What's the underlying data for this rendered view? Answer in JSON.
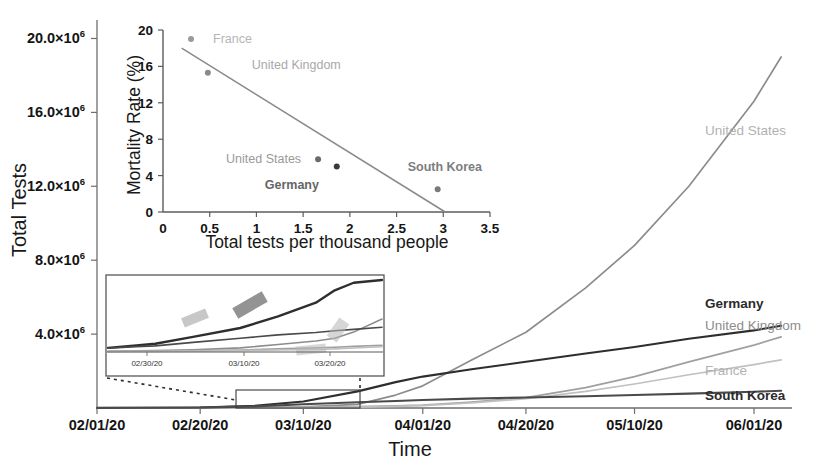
{
  "chart_data": {
    "type": "line",
    "title": "",
    "xlabel": "Time",
    "ylabel": "Total Tests",
    "xtick_labels": [
      "02/01/20",
      "02/20/20",
      "03/10/20",
      "04/01/20",
      "04/20/20",
      "05/10/20",
      "06/01/20"
    ],
    "ytick_labels": [
      "4.0×10",
      "8.0×10",
      "12.0×10",
      "16.0×10",
      "20.0×10"
    ],
    "ytick_exponent": "6",
    "ytick_values": [
      4000000,
      8000000,
      12000000,
      16000000,
      20000000
    ],
    "ylim": [
      0,
      21000000
    ],
    "xlim": [
      "02/01/20",
      "06/08/20"
    ],
    "grid": false,
    "legend_position": "inline-right-of-line-ends",
    "series": [
      {
        "name": "United States",
        "color": "#8c8c8c",
        "label_color": "#b0b0b0",
        "x": [
          "02/01/20",
          "02/20/20",
          "03/01/20",
          "03/10/20",
          "03/20/20",
          "03/27/20",
          "04/01/20",
          "04/10/20",
          "04/20/20",
          "05/01/20",
          "05/10/20",
          "05/20/20",
          "06/01/20",
          "06/06/20"
        ],
        "values": [
          2000,
          8000,
          20000,
          60000,
          200000,
          700000,
          1200000,
          2600000,
          4100000,
          6500000,
          8800000,
          12000000,
          16600000,
          19000000
        ]
      },
      {
        "name": "Germany",
        "color": "#2e2e2e",
        "label_color": "#2b2b2b",
        "x": [
          "02/01/20",
          "02/20/20",
          "03/01/20",
          "03/10/20",
          "03/20/20",
          "03/27/20",
          "04/01/20",
          "04/10/20",
          "04/20/20",
          "05/01/20",
          "05/10/20",
          "05/20/20",
          "06/01/20",
          "06/06/20"
        ],
        "values": [
          5000,
          30000,
          120000,
          350000,
          900000,
          1400000,
          1700000,
          2100000,
          2500000,
          2950000,
          3300000,
          3750000,
          4200000,
          4450000
        ]
      },
      {
        "name": "United Kingdom",
        "color": "#a0a0a0",
        "label_color": "#9b9b9b",
        "x": [
          "02/01/20",
          "02/20/20",
          "03/01/20",
          "03/10/20",
          "03/20/20",
          "03/27/20",
          "04/01/20",
          "04/10/20",
          "04/20/20",
          "05/01/20",
          "05/10/20",
          "05/20/20",
          "06/01/20",
          "06/06/20"
        ],
        "values": [
          1000,
          5000,
          15000,
          30000,
          70000,
          110000,
          160000,
          320000,
          560000,
          1100000,
          1700000,
          2500000,
          3400000,
          3850000
        ]
      },
      {
        "name": "France",
        "color": "#c0c0c0",
        "label_color": "#bdbdbd",
        "x": [
          "02/01/20",
          "02/20/20",
          "03/01/20",
          "03/10/20",
          "03/20/20",
          "03/27/20",
          "04/01/20",
          "04/10/20",
          "04/20/20",
          "05/01/20",
          "05/10/20",
          "05/20/20",
          "06/01/20",
          "06/06/20"
        ],
        "values": [
          500,
          2000,
          8000,
          20000,
          45000,
          90000,
          130000,
          280000,
          500000,
          900000,
          1300000,
          1800000,
          2350000,
          2600000
        ]
      },
      {
        "name": "South Korea",
        "color": "#4a4a4a",
        "label_color": "#2b2b2b",
        "x": [
          "02/01/20",
          "02/20/20",
          "03/01/20",
          "03/10/20",
          "03/20/20",
          "03/27/20",
          "04/01/20",
          "04/10/20",
          "04/20/20",
          "05/01/20",
          "05/10/20",
          "05/20/20",
          "06/01/20",
          "06/06/20"
        ],
        "values": [
          3000,
          20000,
          90000,
          200000,
          310000,
          380000,
          430000,
          510000,
          570000,
          640000,
          700000,
          780000,
          880000,
          930000
        ]
      }
    ],
    "magnifier_inset": {
      "description": "zoomed view of 02/25/20 - 03/25/20 region",
      "xtick_labels": [
        "02/30/20",
        "03/10/20",
        "03/20/20"
      ],
      "source_region": {
        "x_from": "02/27/20",
        "x_to": "03/24/20"
      }
    },
    "scatter_inset": {
      "type": "scatter",
      "xlabel": "Total tests per thousand people",
      "ylabel": "Mortality Rate (%)",
      "xlim": [
        0,
        3.5
      ],
      "ylim": [
        0,
        20
      ],
      "xtick_labels": [
        "0",
        "0.5",
        "1",
        "1.5",
        "2",
        "2.5",
        "3",
        "3.5"
      ],
      "xtick_values": [
        0,
        0.5,
        1,
        1.5,
        2,
        2.5,
        3,
        3.5
      ],
      "ytick_labels": [
        "0",
        "4",
        "8",
        "12",
        "16",
        "20"
      ],
      "ytick_values": [
        0,
        4,
        8,
        12,
        16,
        20
      ],
      "grid": false,
      "points": [
        {
          "label": "France",
          "x": 0.3,
          "y": 19.0,
          "color": "#9a9a9a",
          "label_color": "#b5b5b5",
          "label_dx": 22,
          "label_dy": 4
        },
        {
          "label": "United Kingdom",
          "x": 0.48,
          "y": 15.3,
          "color": "#8a8a8a",
          "label_color": "#a8a8a8",
          "label_dx": 44,
          "label_dy": -4
        },
        {
          "label": "United States",
          "x": 1.66,
          "y": 5.8,
          "color": "#6a6a6a",
          "label_color": "#9a9a9a",
          "label_dx": -92,
          "label_dy": 4
        },
        {
          "label": "Germany",
          "x": 1.86,
          "y": 5.0,
          "color": "#3a3a3a",
          "label_color": "#666666",
          "label_dx": -72,
          "label_dy": 22
        },
        {
          "label": "South Korea",
          "x": 2.94,
          "y": 2.5,
          "color": "#7a7a7a",
          "label_color": "#7d7d7d",
          "label_dx": -30,
          "label_dy": -18
        }
      ],
      "trendline": {
        "x1": 0.2,
        "y1": 18.0,
        "x2": 3.02,
        "y2": 0.0,
        "color": "#8a8a8a"
      }
    }
  },
  "axes": {
    "y_title": "Total Tests",
    "x_title": "Time"
  },
  "inset_axes": {
    "y_title": "Mortality Rate (%)",
    "x_title": "Total tests per thousand people"
  }
}
